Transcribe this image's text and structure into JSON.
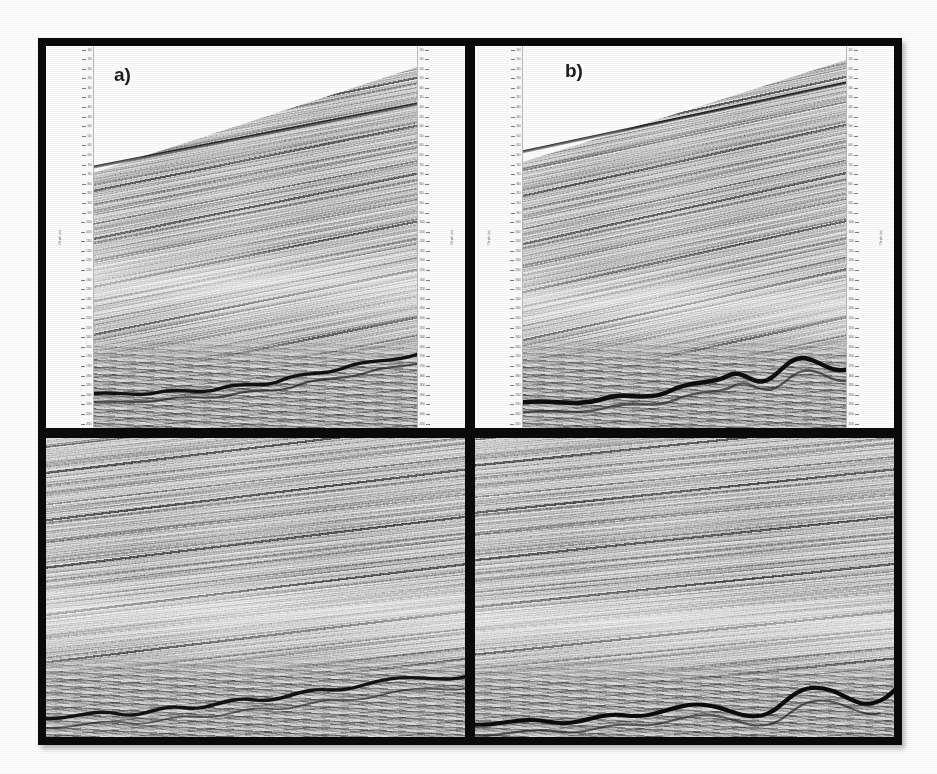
{
  "figure": {
    "type": "seismic-reflection-section-figure",
    "layout": "2x2 grid of grayscale seismic profiles; top row annotated with depth/time scales, bottom row enlarged detail views",
    "frame_color": "#000000",
    "page_background": "#ffffff",
    "data_background": "#b2b2b2"
  },
  "panels": [
    {
      "id": "panel-a",
      "label": "a)",
      "row": "top",
      "column": "left",
      "has_axes": true,
      "description": "Seismic profile with dipping parallel reflectors rising to the right, white no-data wedge above the seafloor reflector, and a chaotic folded/faulted zone at the base.",
      "dip_degrees": 12,
      "axis": {
        "left_title": "Depth (m)",
        "right_title": "Depth (m)",
        "tick_count": 40,
        "tick_labels": [
          "100",
          "150",
          "200",
          "250",
          "300",
          "350",
          "400",
          "450",
          "500",
          "550",
          "600",
          "650",
          "700",
          "750",
          "800",
          "850",
          "900",
          "950",
          "1000",
          "1050",
          "1100",
          "1150",
          "1200",
          "1250",
          "1300",
          "1350",
          "1400",
          "1450",
          "1500",
          "1550",
          "1600",
          "1650",
          "1700",
          "1750",
          "1800",
          "1850",
          "1900",
          "1950",
          "2000",
          "2050"
        ]
      }
    },
    {
      "id": "panel-b",
      "label": "b)",
      "row": "top",
      "column": "right",
      "has_axes": true,
      "description": "Seismic profile with dipping parallel reflectors rising to the right and a strong undulating basal reflector with localized folds.",
      "dip_degrees": 13,
      "axis": {
        "left_title": "Depth (m)",
        "right_title": "Depth (m)",
        "tick_count": 40,
        "tick_labels": [
          "100",
          "150",
          "200",
          "250",
          "300",
          "350",
          "400",
          "450",
          "500",
          "550",
          "600",
          "650",
          "700",
          "750",
          "800",
          "850",
          "900",
          "950",
          "1000",
          "1050",
          "1100",
          "1150",
          "1200",
          "1250",
          "1300",
          "1350",
          "1400",
          "1450",
          "1500",
          "1550",
          "1600",
          "1650",
          "1700",
          "1750",
          "1800",
          "1850",
          "1900",
          "1950",
          "2000",
          "2050"
        ]
      }
    },
    {
      "id": "panel-c",
      "label": "",
      "row": "bottom",
      "column": "left",
      "has_axes": false,
      "description": "Enlarged detail of panel a: gently dipping layered reflectors with a deformed, thrusted zone along the lower boundary.",
      "dip_degrees": 7,
      "axis": null
    },
    {
      "id": "panel-d",
      "label": "",
      "row": "bottom",
      "column": "right",
      "has_axes": false,
      "description": "Enlarged detail of panel b: layered reflectors truncated by an undulating high-amplitude basal horizon with a small fold.",
      "dip_degrees": 6,
      "axis": null
    }
  ],
  "chart_data": {
    "type": "heatmap",
    "title": "",
    "subtitle": "",
    "xlabel": "",
    "ylabel": "Depth (m)",
    "grid": false,
    "legend": "none",
    "colormap": "grayscale",
    "annotations": [
      "a)",
      "b)"
    ]
  }
}
